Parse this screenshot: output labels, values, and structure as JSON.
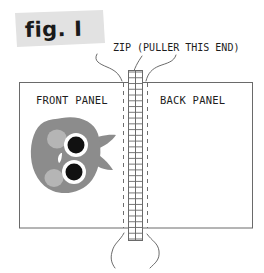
{
  "figure": {
    "banner_label": "fig. I",
    "banner_color": "#e2e2e2",
    "callout_label": "ZIP (PULLER THIS END)",
    "front_panel_label": "FRONT PANEL",
    "back_panel_label": "BACK PANEL",
    "background_color": "#ffffff",
    "line_color": "#5a5a5a",
    "text_color": "#1d1d1d",
    "blob": {
      "body_color": "#8c8c8c",
      "cheek_color": "#b5b5b5",
      "eye_color": "#111111",
      "eye_ring_color": "#ffffff",
      "nose_color": "#ffffff"
    },
    "zipper": {
      "strip_color": "#ffffff",
      "tooth_color": "#6a6a6a",
      "dashed_guide_color": "#6e6e6e",
      "tooth_count": 29
    }
  }
}
